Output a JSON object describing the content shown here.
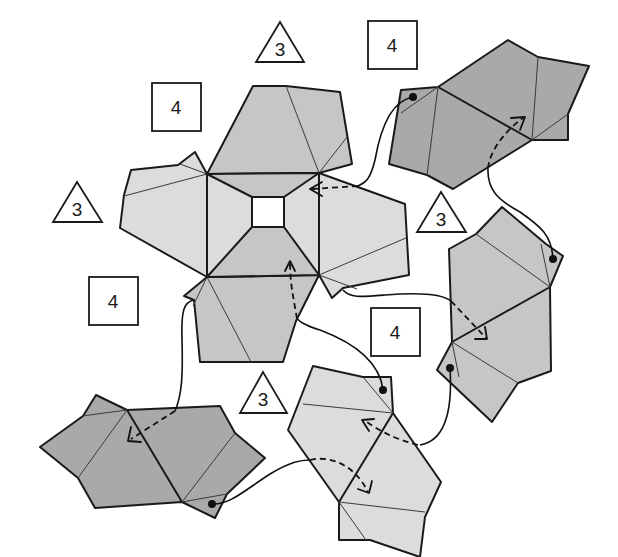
{
  "diagram": {
    "colors": {
      "background": "#ffffff",
      "light_face": "#dcdcdc",
      "mid_face": "#c6c6c6",
      "dark_face": "#a9a9a9",
      "line": "#1a1a1a"
    },
    "labels": [
      {
        "id": "tri-top",
        "shape": "triangle",
        "text": "3"
      },
      {
        "id": "sq-top-right",
        "shape": "square",
        "text": "4"
      },
      {
        "id": "sq-top-left",
        "shape": "square",
        "text": "4"
      },
      {
        "id": "tri-left",
        "shape": "triangle",
        "text": "3"
      },
      {
        "id": "tri-right",
        "shape": "triangle",
        "text": "3"
      },
      {
        "id": "sq-left",
        "shape": "square",
        "text": "4"
      },
      {
        "id": "sq-middle",
        "shape": "square",
        "text": "4"
      },
      {
        "id": "tri-bottom",
        "shape": "triangle",
        "text": "3"
      }
    ],
    "pieces": [
      {
        "id": "central-piece",
        "tone": "light",
        "has_center_hole": true
      },
      {
        "id": "top-right-piece",
        "tone": "dark"
      },
      {
        "id": "right-piece",
        "tone": "mid"
      },
      {
        "id": "bottom-center-piece",
        "tone": "light"
      },
      {
        "id": "bottom-left-piece",
        "tone": "dark"
      }
    ],
    "connectors": [
      {
        "from": "top-right-piece tab",
        "to": "central-piece right-top",
        "style": "solid+dashed arrow"
      },
      {
        "from": "right-piece",
        "to": "top-right-piece",
        "style": "solid+dashed arrow"
      },
      {
        "from": "central-piece right tab",
        "to": "right-piece",
        "style": "solid+dashed arrow"
      },
      {
        "from": "bottom-center-piece",
        "to": "central-piece bottom",
        "style": "solid+dashed arrow"
      },
      {
        "from": "right-piece lower tab",
        "to": "bottom-center-piece",
        "style": "solid+dashed arrow"
      },
      {
        "from": "central-piece lower-left tab",
        "to": "bottom-left-piece",
        "style": "solid+dashed arrow"
      },
      {
        "from": "bottom-left-piece tab",
        "to": "bottom-center-piece",
        "style": "solid+dashed arrow"
      }
    ]
  }
}
